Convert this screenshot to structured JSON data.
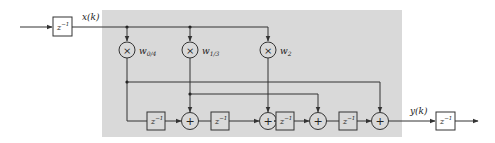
{
  "diagram": {
    "title": "",
    "type": "block-diagram",
    "colors": {
      "background": "#ffffff",
      "shaded_region": "#d9d9d9",
      "stroke": "#333333"
    },
    "signals": {
      "input": "x(k)",
      "output": "y(k)"
    },
    "blocks": {
      "delay_label_base": "z",
      "delay_label_exp": "−1",
      "input_delay": "z⁻¹",
      "output_delay": "z⁻¹",
      "chain_delays": [
        "z⁻¹",
        "z⁻¹",
        "z⁻¹",
        "z⁻¹"
      ]
    },
    "multipliers": [
      {
        "symbol": "×",
        "weight_base": "w",
        "weight_sub": "0/4"
      },
      {
        "symbol": "×",
        "weight_base": "w",
        "weight_sub": "1/3"
      },
      {
        "symbol": "×",
        "weight_base": "w",
        "weight_sub": "2"
      }
    ],
    "adders": [
      {
        "symbol": "+"
      },
      {
        "symbol": "+"
      },
      {
        "symbol": "+"
      },
      {
        "symbol": "+"
      }
    ]
  }
}
